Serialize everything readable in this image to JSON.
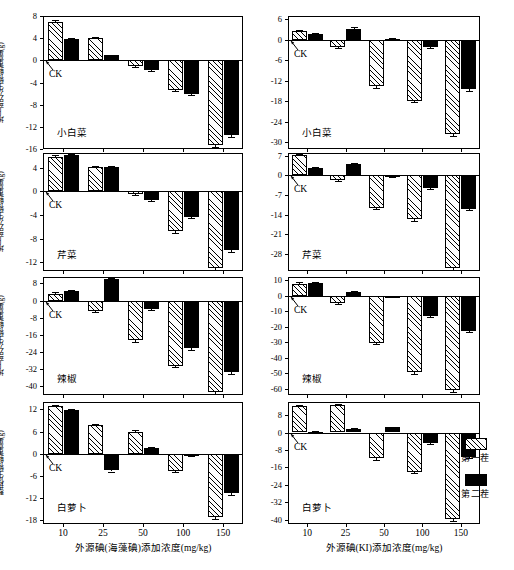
{
  "figure": {
    "legend": {
      "items": [
        {
          "label": "第一茬",
          "style": "hatch"
        },
        {
          "label": "第二茬",
          "style": "solid"
        }
      ]
    },
    "x_axis_left_title": "外源碘(海藻碘)添加浓度(mg/kg)",
    "x_axis_right_title": "外源碘(KI)添加浓度(mg/kg)",
    "ck_label": "CK"
  },
  "chart_data": [
    {
      "type": "bar",
      "panel_id": "left-1",
      "title": "小白菜",
      "xlabel": "外源碘(海藻碘)添加浓度(mg/kg)",
      "ylabel": "地上部分生物鲜重量(g)",
      "categories": [
        "10",
        "25",
        "50",
        "100",
        "150"
      ],
      "yticks": [
        8,
        4,
        0,
        -4,
        -8,
        -12,
        -16
      ],
      "ylim": [
        -16,
        8
      ],
      "series": [
        {
          "name": "第一茬",
          "style": "hatch",
          "values": [
            6.9,
            4.0,
            -1.0,
            -5.4,
            -15.3
          ],
          "errors": [
            0.3,
            0.2,
            0.2,
            0.2,
            0.3
          ]
        },
        {
          "name": "第二茬",
          "style": "solid",
          "values": [
            3.9,
            0.9,
            -1.7,
            -6.1,
            -13.5
          ],
          "errors": [
            0.2,
            0.1,
            0.2,
            0.2,
            0.3
          ]
        }
      ]
    },
    {
      "type": "bar",
      "panel_id": "left-2",
      "title": "芹菜",
      "xlabel": "外源碘(海藻碘)添加浓度(mg/kg)",
      "ylabel": "地上部分生物鲜重量(g)",
      "categories": [
        "10",
        "25",
        "50",
        "100",
        "150"
      ],
      "yticks": [
        4,
        0,
        -4,
        -8,
        -12
      ],
      "ylim": [
        -13.5,
        6.5
      ],
      "series": [
        {
          "name": "第一茬",
          "style": "hatch",
          "values": [
            5.8,
            4.1,
            -0.5,
            -6.7,
            -13.0
          ],
          "errors": [
            0.3,
            0.2,
            0.2,
            0.3,
            0.3
          ]
        },
        {
          "name": "第二茬",
          "style": "solid",
          "values": [
            6.2,
            4.1,
            -1.5,
            -4.3,
            -10.0
          ],
          "errors": [
            0.2,
            0.2,
            0.2,
            0.2,
            0.3
          ]
        }
      ]
    },
    {
      "type": "bar",
      "panel_id": "left-3",
      "title": "辣椒",
      "xlabel": "外源碘(海藻碘)添加浓度(mg/kg)",
      "ylabel": "地上部分生物鲜重量(g)",
      "categories": [
        "10",
        "25",
        "50",
        "100",
        "150"
      ],
      "yticks": [
        8,
        0,
        -8,
        -16,
        -24,
        -32,
        -40
      ],
      "ylim": [
        -44,
        11
      ],
      "series": [
        {
          "name": "第一茬",
          "style": "hatch",
          "values": [
            3.2,
            -5.0,
            -18.3,
            -30.3,
            -42.5
          ],
          "errors": [
            0.6,
            0.5,
            0.8,
            0.8,
            0.9
          ]
        },
        {
          "name": "第二茬",
          "style": "solid",
          "values": [
            4.6,
            10.0,
            -4.0,
            -22.3,
            -33.2
          ],
          "errors": [
            0.5,
            0.6,
            0.5,
            0.8,
            0.8
          ]
        }
      ]
    },
    {
      "type": "bar",
      "panel_id": "left-4",
      "title": "白萝卜",
      "xlabel": "外源碘(海藻碘)添加浓度(mg/kg)",
      "ylabel": "整株生物鲜重量(g)",
      "categories": [
        "10",
        "25",
        "50",
        "100",
        "150"
      ],
      "yticks": [
        12,
        6,
        0,
        -6,
        -12,
        -18
      ],
      "ylim": [
        -19,
        14
      ],
      "series": [
        {
          "name": "第一茬",
          "style": "hatch",
          "values": [
            12.8,
            7.7,
            6.0,
            -4.7,
            -17.2
          ],
          "errors": [
            0.4,
            0.3,
            0.3,
            0.3,
            0.5
          ]
        },
        {
          "name": "第二茬",
          "style": "solid",
          "values": [
            11.9,
            -4.5,
            1.6,
            -0.5,
            -10.7
          ],
          "errors": [
            0.3,
            0.3,
            0.2,
            0.2,
            0.4
          ]
        }
      ]
    },
    {
      "type": "bar",
      "panel_id": "right-1",
      "title": "小白菜",
      "xlabel": "外源碘(KI)添加浓度(mg/kg)",
      "ylabel": "地上部分生物鲜重量(g)",
      "categories": [
        "10",
        "25",
        "50",
        "100",
        "150"
      ],
      "yticks": [
        6,
        0,
        -6,
        -12,
        -18,
        -24,
        -30
      ],
      "ylim": [
        -32,
        7
      ],
      "series": [
        {
          "name": "第一茬",
          "style": "hatch",
          "values": [
            2.6,
            -2.1,
            -13.5,
            -17.8,
            -27.5
          ],
          "errors": [
            0.4,
            0.3,
            0.5,
            0.5,
            0.7
          ]
        },
        {
          "name": "第二茬",
          "style": "solid",
          "values": [
            1.7,
            3.3,
            0.3,
            -2.2,
            -14.5
          ],
          "errors": [
            0.3,
            0.4,
            0.2,
            0.3,
            0.6
          ]
        }
      ]
    },
    {
      "type": "bar",
      "panel_id": "right-2",
      "title": "芹菜",
      "xlabel": "外源碘(KI)添加浓度(mg/kg)",
      "ylabel": "地上部分生物鲜重量(g)",
      "categories": [
        "10",
        "25",
        "50",
        "100",
        "150"
      ],
      "yticks": [
        7,
        0,
        -7,
        -14,
        -21,
        -28
      ],
      "ylim": [
        -34,
        8
      ],
      "series": [
        {
          "name": "第一茬",
          "style": "hatch",
          "values": [
            7.3,
            -1.7,
            -11.5,
            -15.5,
            -33.0
          ],
          "errors": [
            0.4,
            0.3,
            0.5,
            0.6,
            0.7
          ]
        },
        {
          "name": "第二茬",
          "style": "solid",
          "values": [
            2.8,
            4.1,
            -0.3,
            -4.5,
            -11.8
          ],
          "errors": [
            0.3,
            0.3,
            0.2,
            0.4,
            0.5
          ]
        }
      ]
    },
    {
      "type": "bar",
      "panel_id": "right-3",
      "title": "辣椒",
      "xlabel": "外源碘(KI)添加浓度(mg/kg)",
      "ylabel": "地上部分生物鲜重量(g)",
      "categories": [
        "10",
        "25",
        "50",
        "100",
        "150"
      ],
      "yticks": [
        10,
        0,
        -10,
        -20,
        -30,
        -40,
        -50,
        -60
      ],
      "ylim": [
        -64,
        12
      ],
      "series": [
        {
          "name": "第一茬",
          "style": "hatch",
          "values": [
            7.8,
            -5.0,
            -30.2,
            -49.5,
            -61.0
          ],
          "errors": [
            0.7,
            0.6,
            1.0,
            1.1,
            1.2
          ]
        },
        {
          "name": "第二茬",
          "style": "solid",
          "values": [
            8.2,
            2.3,
            -0.8,
            -13.2,
            -22.5
          ],
          "errors": [
            0.6,
            0.5,
            0.4,
            0.8,
            0.9
          ]
        }
      ]
    },
    {
      "type": "bar",
      "panel_id": "right-4",
      "title": "白萝卜",
      "xlabel": "外源碘(KI)添加浓度(mg/kg)",
      "ylabel": "整株生物鲜重量(g)",
      "categories": [
        "10",
        "25",
        "50",
        "100",
        "150"
      ],
      "yticks": [
        8,
        0,
        -8,
        -16,
        -24,
        -32,
        -40
      ],
      "ylim": [
        -42,
        14
      ],
      "series": [
        {
          "name": "第一茬",
          "style": "hatch",
          "values": [
            12.0,
            12.6,
            -11.8,
            -18.0,
            -39.8
          ],
          "errors": [
            0.5,
            0.5,
            0.6,
            0.7,
            0.9
          ]
        },
        {
          "name": "第二茬",
          "style": "solid",
          "values": [
            0.3,
            1.7,
            2.3,
            -4.8,
            -11.2
          ],
          "errors": [
            0.2,
            0.3,
            0.3,
            0.4,
            0.5
          ]
        }
      ]
    }
  ],
  "panels_layout": [
    {
      "id": "left-1",
      "x": 43,
      "y": 16,
      "w": 200,
      "h": 133,
      "ytitle": "地上部分生物鲜重量(g)"
    },
    {
      "id": "left-2",
      "x": 43,
      "y": 153,
      "w": 200,
      "h": 118,
      "ytitle": "地上部分生物鲜重量(g)"
    },
    {
      "id": "left-3",
      "x": 43,
      "y": 277,
      "w": 200,
      "h": 118,
      "ytitle": "地上部分生物鲜重量(g)"
    },
    {
      "id": "left-4",
      "x": 43,
      "y": 402,
      "w": 200,
      "h": 122,
      "ytitle": "整株生物鲜重量(g)"
    },
    {
      "id": "right-1",
      "x": 288,
      "y": 16,
      "w": 192,
      "h": 133,
      "ytitle": ""
    },
    {
      "id": "right-2",
      "x": 288,
      "y": 153,
      "w": 192,
      "h": 118,
      "ytitle": ""
    },
    {
      "id": "right-3",
      "x": 288,
      "y": 277,
      "w": 192,
      "h": 118,
      "ytitle": ""
    },
    {
      "id": "right-4",
      "x": 288,
      "y": 402,
      "w": 192,
      "h": 122,
      "ytitle": ""
    }
  ]
}
